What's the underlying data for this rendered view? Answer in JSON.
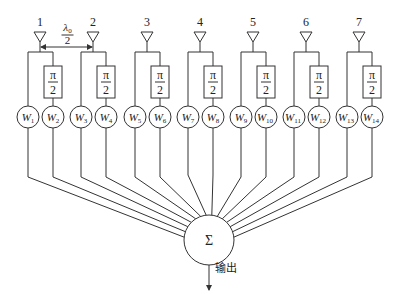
{
  "diagram": {
    "title": "",
    "colors": {
      "line": "#333333",
      "text": "#222222",
      "background": "#ffffff"
    },
    "antennas": [
      {
        "number": "1",
        "x": 40
      },
      {
        "number": "2",
        "x": 93
      },
      {
        "number": "3",
        "x": 147
      },
      {
        "number": "4",
        "x": 200
      },
      {
        "number": "5",
        "x": 253
      },
      {
        "number": "6",
        "x": 306
      },
      {
        "number": "7",
        "x": 359
      }
    ],
    "spacing_label": {
      "numerator": "λ",
      "subscript": "0",
      "denominator": "2"
    },
    "phase_shifter": {
      "numerator": "π",
      "denominator": "2"
    },
    "weights": [
      {
        "label": "W",
        "sub": "1"
      },
      {
        "label": "W",
        "sub": "2"
      },
      {
        "label": "W",
        "sub": "3"
      },
      {
        "label": "W",
        "sub": "4"
      },
      {
        "label": "W",
        "sub": "5"
      },
      {
        "label": "W",
        "sub": "6"
      },
      {
        "label": "W",
        "sub": "7"
      },
      {
        "label": "W",
        "sub": "8"
      },
      {
        "label": "W",
        "sub": "9"
      },
      {
        "label": "W",
        "sub": "10"
      },
      {
        "label": "W",
        "sub": "11"
      },
      {
        "label": "W",
        "sub": "12"
      },
      {
        "label": "W",
        "sub": "13"
      },
      {
        "label": "W",
        "sub": "14"
      }
    ],
    "summer": {
      "symbol": "Σ"
    },
    "output": {
      "label": "输出"
    }
  }
}
